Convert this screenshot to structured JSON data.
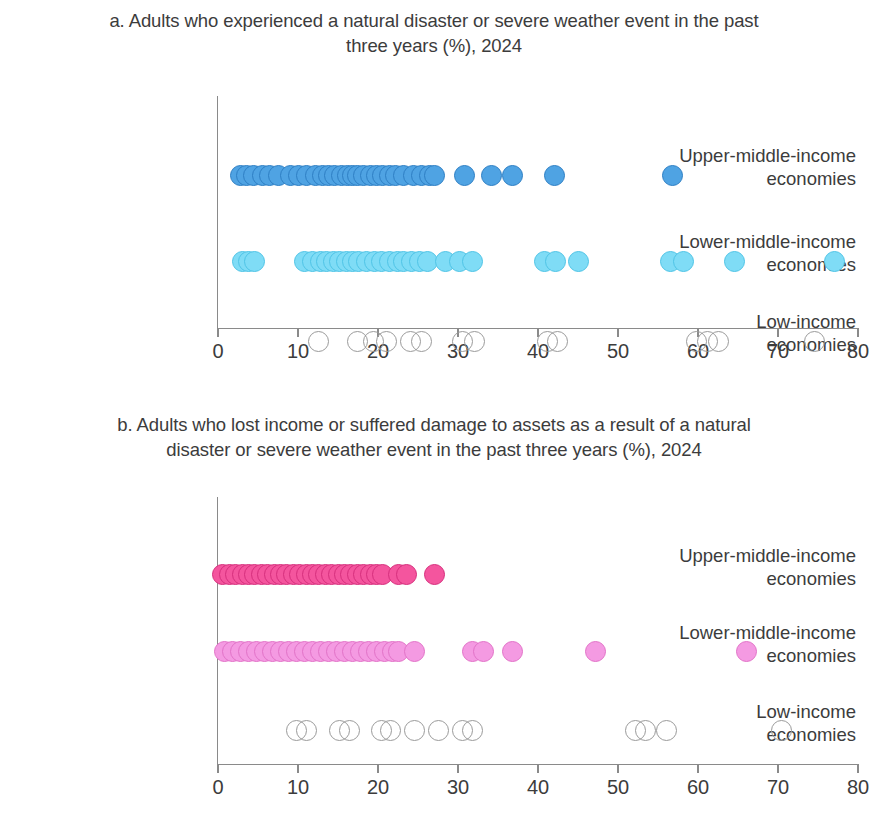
{
  "figure": {
    "panels": [
      {
        "id": "a",
        "title": "a. Adults who experienced a natural disaster or severe weather event in the past three years (%), 2024"
      },
      {
        "id": "b",
        "title": "b. Adults who lost income or suffered damage to assets as a result of a natural disaster or severe weather event in the past three years (%), 2024"
      }
    ],
    "category_labels": [
      "Upper-middle-income economies",
      "Lower-middle-income economies",
      "Low-income economies"
    ],
    "tick_labels": [
      "0",
      "10",
      "20",
      "30",
      "40",
      "50",
      "60",
      "70",
      "80"
    ],
    "colors": {
      "upper_middle_a": "#4fa3e3",
      "lower_middle_a": "#7fdcf6",
      "low_income_a": "#ffffff",
      "upper_middle_b": "#f4559e",
      "lower_middle_b": "#f49ae2",
      "low_income_b": "#ffffff",
      "axis": "#8a8a8a",
      "text": "#3c3c3c"
    }
  },
  "chart_data": [
    {
      "type": "scatter",
      "panel": "a",
      "title": "a. Adults who experienced a natural disaster or severe weather event in the past three years (%), 2024",
      "xlabel": "",
      "ylabel": "",
      "xlim": [
        0,
        80
      ],
      "xticks": [
        0,
        10,
        20,
        30,
        40,
        50,
        60,
        70,
        80
      ],
      "grid": false,
      "legend": "none",
      "categories": [
        "Upper-middle-income economies",
        "Lower-middle-income economies",
        "Low-income economies"
      ],
      "series": [
        {
          "name": "Upper-middle-income economies",
          "color": "#4fa3e3",
          "values": [
            2.8,
            3.6,
            4.4,
            5.6,
            6.4,
            7.6,
            9.0,
            10.0,
            11.0,
            12.2,
            13.0,
            13.8,
            14.6,
            15.4,
            16.2,
            16.8,
            17.4,
            18.2,
            19.0,
            19.8,
            20.6,
            21.4,
            22.2,
            23.2,
            24.4,
            25.4,
            26.4,
            27.0,
            30.8,
            34.2,
            36.8,
            42.0,
            56.8
          ]
        },
        {
          "name": "Lower-middle-income economies",
          "color": "#7fdcf6",
          "values": [
            3.0,
            3.8,
            4.6,
            10.8,
            11.8,
            12.8,
            13.6,
            14.4,
            15.2,
            16.0,
            16.8,
            17.6,
            18.6,
            19.6,
            20.4,
            21.4,
            22.4,
            23.2,
            24.2,
            25.2,
            26.2,
            28.4,
            30.2,
            31.8,
            40.8,
            42.2,
            45.0,
            56.6,
            58.2,
            64.6,
            77.0
          ]
        },
        {
          "name": "Low-income economies",
          "color": "#ffffff",
          "values": [
            12.6,
            17.4,
            19.4,
            21.0,
            24.0,
            25.4,
            30.6,
            32.0,
            41.2,
            42.4,
            59.8,
            61.2,
            62.6,
            74.6
          ]
        }
      ]
    },
    {
      "type": "scatter",
      "panel": "b",
      "title": "b. Adults who lost income or suffered damage to assets as a result of a natural disaster or severe weather event in the past three years (%), 2024",
      "xlabel": "",
      "ylabel": "",
      "xlim": [
        0,
        80
      ],
      "xticks": [
        0,
        10,
        20,
        30,
        40,
        50,
        60,
        70,
        80
      ],
      "grid": false,
      "legend": "none",
      "categories": [
        "Upper-middle-income economies",
        "Lower-middle-income economies",
        "Low-income economies"
      ],
      "series": [
        {
          "name": "Upper-middle-income economies",
          "color": "#f4559e",
          "values": [
            0.6,
            1.4,
            2.2,
            3.0,
            3.8,
            4.6,
            5.4,
            6.2,
            7.0,
            7.8,
            8.6,
            9.4,
            10.2,
            11.0,
            11.8,
            12.6,
            13.4,
            14.2,
            15.0,
            15.8,
            16.6,
            17.4,
            18.2,
            19.0,
            19.8,
            20.6,
            22.6,
            23.6,
            27.0
          ]
        },
        {
          "name": "Lower-middle-income economies",
          "color": "#f49ae2",
          "values": [
            0.8,
            1.8,
            2.8,
            3.8,
            4.8,
            5.8,
            6.8,
            7.8,
            8.8,
            9.8,
            10.8,
            11.8,
            12.8,
            13.8,
            14.8,
            15.8,
            16.8,
            17.8,
            18.8,
            19.8,
            20.8,
            21.8,
            22.6,
            24.6,
            31.8,
            33.2,
            36.8,
            47.2,
            66.0
          ]
        },
        {
          "name": "Low-income economies",
          "color": "#ffffff",
          "values": [
            9.8,
            11.0,
            15.2,
            16.4,
            20.4,
            21.6,
            24.6,
            27.6,
            30.6,
            31.8,
            52.2,
            53.4,
            56.0,
            70.4
          ]
        }
      ]
    }
  ]
}
